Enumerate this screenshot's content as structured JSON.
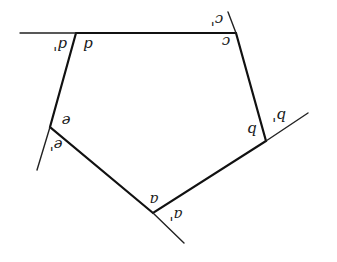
{
  "diagram": {
    "type": "pentagon-exterior-angles",
    "stroke_color": "#111111",
    "vertices": {
      "A": {
        "x": 153,
        "y": 213
      },
      "B": {
        "x": 266,
        "y": 141
      },
      "C": {
        "x": 236,
        "y": 33
      },
      "D": {
        "x": 76,
        "y": 33
      },
      "E": {
        "x": 50,
        "y": 127
      }
    },
    "extensions": {
      "D": {
        "x": 20,
        "y": 33
      },
      "C": {
        "x": 228,
        "y": 12
      },
      "B": {
        "x": 308,
        "y": 113
      },
      "A": {
        "x": 184,
        "y": 243
      },
      "E": {
        "x": 37,
        "y": 170
      }
    },
    "labels": {
      "d_interior": "d",
      "d_exterior": "d'",
      "c_interior": "c",
      "c_exterior": "c'",
      "b_interior": "b",
      "b_exterior": "b'",
      "a_interior": "a",
      "a_exterior": "a'",
      "e_interior": "e",
      "e_exterior": "e'"
    }
  }
}
